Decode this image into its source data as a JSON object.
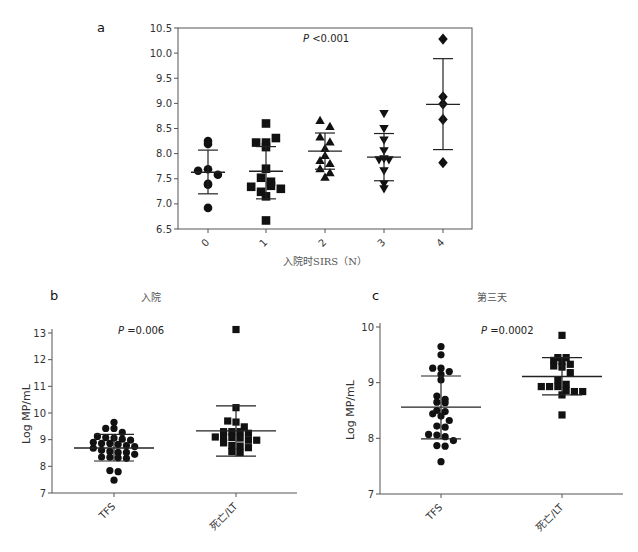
{
  "chart_data": [
    {
      "panel": "a",
      "type": "scatter",
      "title": "",
      "xlabel": "入院时SIRS（N）",
      "ylabel": "",
      "annotation": "P<0.001",
      "ylim": [
        6.5,
        10.5
      ],
      "yticks": [
        "6.5",
        "7.0",
        "7.5",
        "8.0",
        "8.5",
        "9.0",
        "9.5",
        "10.0",
        "10.5"
      ],
      "categories": [
        "0",
        "1",
        "2",
        "3",
        "4"
      ],
      "markers": [
        "circle",
        "square",
        "triangle-up",
        "triangle-down",
        "diamond"
      ],
      "series": [
        {
          "name": "0",
          "values": [
            8.25,
            8.19,
            7.66,
            7.69,
            7.58,
            7.4,
            7.38,
            6.92
          ],
          "mean": 7.63,
          "sd_low": 7.2,
          "sd_high": 8.07
        },
        {
          "name": "1",
          "values": [
            8.6,
            8.22,
            8.13,
            8.22,
            8.31,
            7.7,
            7.52,
            7.44,
            7.34,
            7.24,
            7.36,
            7.3,
            7.15,
            6.67
          ],
          "mean": 7.65,
          "sd_low": 7.1,
          "sd_high": 8.14
        },
        {
          "name": "2",
          "values": [
            8.66,
            8.54,
            8.33,
            8.23,
            8.1,
            7.96,
            7.86,
            7.8,
            7.7,
            7.62,
            7.53
          ],
          "mean": 8.05,
          "sd_low": 7.69,
          "sd_high": 8.41
        },
        {
          "name": "3",
          "values": [
            8.8,
            8.5,
            8.27,
            8.06,
            7.9,
            7.88,
            7.88,
            7.66,
            7.4,
            7.3
          ],
          "mean": 7.93,
          "sd_low": 7.46,
          "sd_high": 8.4
        },
        {
          "name": "4",
          "values": [
            10.28,
            9.13,
            8.99,
            8.68,
            7.82
          ],
          "mean": 8.98,
          "sd_low": 8.08,
          "sd_high": 9.89
        }
      ]
    },
    {
      "panel": "b",
      "type": "scatter",
      "title": "入院",
      "xlabel": "",
      "ylabel": "Log MP/mL",
      "annotation": "P=0.006",
      "ylim": [
        7,
        13
      ],
      "yticks": [
        "7",
        "8",
        "9",
        "10",
        "11",
        "12",
        "13"
      ],
      "categories": [
        "TFS",
        "死亡/LT"
      ],
      "markers": [
        "circle",
        "square"
      ],
      "series": [
        {
          "name": "TFS",
          "values": [
            9.65,
            9.42,
            9.42,
            9.27,
            9.12,
            9.08,
            9.06,
            9.02,
            8.98,
            8.9,
            8.86,
            8.86,
            8.82,
            8.78,
            8.74,
            8.68,
            8.6,
            8.56,
            8.52,
            8.52,
            8.45,
            8.35,
            8.34,
            8.32,
            8.3,
            7.84,
            7.8,
            7.48
          ],
          "mean": 8.69,
          "sd_low": 8.2,
          "sd_high": 9.2
        },
        {
          "name": "死亡/LT",
          "values": [
            13.13,
            10.2,
            9.7,
            9.66,
            9.48,
            9.3,
            9.3,
            9.3,
            9.24,
            9.1,
            9.1,
            9.08,
            9.06,
            8.98,
            8.98,
            8.88,
            8.78,
            8.76,
            8.7,
            8.55,
            8.52
          ],
          "mean": 9.33,
          "sd_low": 8.38,
          "sd_high": 10.27
        }
      ]
    },
    {
      "panel": "c",
      "type": "scatter",
      "title": "第三天",
      "xlabel": "",
      "ylabel": "Log MP/mL",
      "annotation": "P=0.0002",
      "ylim": [
        7,
        10
      ],
      "yticks": [
        "7",
        "8",
        "9",
        "10"
      ],
      "categories": [
        "TFS",
        "死亡/LT"
      ],
      "markers": [
        "circle",
        "square"
      ],
      "series": [
        {
          "name": "TFS",
          "values": [
            9.65,
            9.5,
            9.26,
            9.26,
            9.2,
            9.15,
            9.05,
            8.76,
            8.7,
            8.65,
            8.64,
            8.5,
            8.48,
            8.44,
            8.4,
            8.32,
            8.22,
            8.2,
            8.07,
            8.06,
            8.03,
            7.96,
            7.87,
            7.86,
            7.58
          ],
          "mean": 8.56,
          "sd_low": 7.99,
          "sd_high": 9.12
        },
        {
          "name": "死亡/LT",
          "values": [
            9.85,
            9.45,
            9.45,
            9.4,
            9.38,
            9.33,
            9.3,
            9.28,
            9.18,
            9.05,
            8.97,
            8.93,
            8.93,
            8.93,
            8.86,
            8.84,
            8.84,
            8.78,
            8.42
          ],
          "mean": 9.11,
          "sd_low": 8.78,
          "sd_high": 9.45
        }
      ]
    }
  ],
  "labels": {
    "panel_a": "a",
    "panel_b": "b",
    "panel_c": "c",
    "title_b": "入院",
    "title_c": "第三天",
    "xlabel_a": "入院时SIRS（N）",
    "ylabel_b": "Log MP/mL",
    "ylabel_c": "Log MP/mL",
    "p_a_italic": "P",
    "p_a_rest": " <0.001",
    "p_b_italic": "P",
    "p_b_rest": " =0.006",
    "p_c_italic": "P",
    "p_c_rest": " =0.0002"
  }
}
